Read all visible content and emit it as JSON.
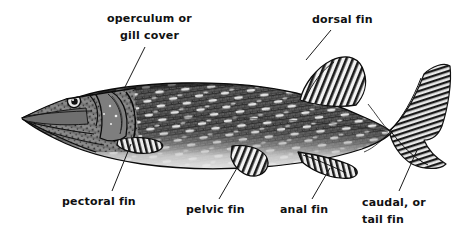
{
  "figure": {
    "background_color": "#ffffff",
    "ink_color": "#111111"
  },
  "labels": [
    {
      "id": "operculum",
      "name": "operculum-label",
      "line1": "operculum or",
      "line2": "gill cover",
      "leader": {
        "x1": 145,
        "y1": 47,
        "x2": 125,
        "y2": 87
      }
    },
    {
      "id": "dorsal",
      "name": "dorsal-fin-label",
      "line1": "dorsal fin",
      "line2": "",
      "leader": {
        "x1": 331,
        "y1": 30,
        "x2": 306,
        "y2": 60
      }
    },
    {
      "id": "pectoral",
      "name": "pectoral-fin-label",
      "line1": "pectoral fin",
      "line2": "",
      "leader": {
        "x1": 131,
        "y1": 144,
        "x2": 112,
        "y2": 191
      }
    },
    {
      "id": "pelvic",
      "name": "pelvic-fin-label",
      "line1": "pelvic fin",
      "line2": "",
      "leader": {
        "x1": 237,
        "y1": 168,
        "x2": 219,
        "y2": 199
      }
    },
    {
      "id": "anal",
      "name": "anal-fin-label",
      "line1": "anal fin",
      "line2": "",
      "leader": {
        "x1": 330,
        "y1": 168,
        "x2": 312,
        "y2": 199
      }
    },
    {
      "id": "caudal",
      "name": "caudal-fin-label",
      "line1": "caudal, or",
      "line2": "tail fin",
      "leader": {
        "x1": 418,
        "y1": 148,
        "x2": 399,
        "y2": 191
      }
    }
  ],
  "fish_parts": [
    "snout",
    "eye",
    "operculum",
    "pectoral fin",
    "pelvic fin",
    "dorsal fin",
    "anal fin",
    "caudal fin",
    "body"
  ]
}
